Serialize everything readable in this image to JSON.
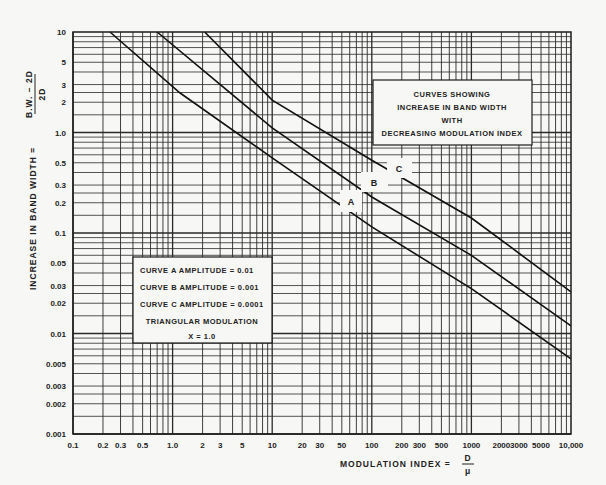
{
  "chart_data": {
    "type": "line",
    "title": "CURVES SHOWING INCREASE IN BAND WIDTH WITH DECREASING MODULATION INDEX",
    "xlabel": "MODULATION INDEX = D/μ",
    "ylabel": "INCREASE IN BAND WIDTH = (B.W. − 2D)/2D",
    "xscale": "log",
    "yscale": "log",
    "xlim": [
      0.1,
      10000
    ],
    "ylim": [
      0.001,
      10
    ],
    "grid": true,
    "x_ticks": [
      {
        "v": 0.1,
        "label": "0.1"
      },
      {
        "v": 0.2,
        "label": "0.2"
      },
      {
        "v": 0.3,
        "label": "0.3"
      },
      {
        "v": 0.5,
        "label": "0.5"
      },
      {
        "v": 1,
        "label": "1.0"
      },
      {
        "v": 2,
        "label": "2"
      },
      {
        "v": 3,
        "label": "3"
      },
      {
        "v": 5,
        "label": "5"
      },
      {
        "v": 10,
        "label": "10"
      },
      {
        "v": 20,
        "label": "20"
      },
      {
        "v": 30,
        "label": "30"
      },
      {
        "v": 50,
        "label": "50"
      },
      {
        "v": 100,
        "label": "100"
      },
      {
        "v": 200,
        "label": "200"
      },
      {
        "v": 300,
        "label": "300"
      },
      {
        "v": 500,
        "label": "500"
      },
      {
        "v": 1000,
        "label": "1000"
      },
      {
        "v": 2000,
        "label": "2000"
      },
      {
        "v": 3000,
        "label": "3000"
      },
      {
        "v": 5000,
        "label": "5000"
      },
      {
        "v": 10000,
        "label": "10,000"
      }
    ],
    "y_ticks": [
      {
        "v": 10,
        "label": "10"
      },
      {
        "v": 5,
        "label": "5"
      },
      {
        "v": 3,
        "label": "3"
      },
      {
        "v": 2,
        "label": "2"
      },
      {
        "v": 1,
        "label": "1.0"
      },
      {
        "v": 0.5,
        "label": "0.5"
      },
      {
        "v": 0.3,
        "label": "0.3"
      },
      {
        "v": 0.2,
        "label": "0.2"
      },
      {
        "v": 0.1,
        "label": "0.1"
      },
      {
        "v": 0.05,
        "label": "0.05"
      },
      {
        "v": 0.03,
        "label": "0.03"
      },
      {
        "v": 0.02,
        "label": "0.02"
      },
      {
        "v": 0.01,
        "label": "0.01"
      },
      {
        "v": 0.005,
        "label": "0.005"
      },
      {
        "v": 0.003,
        "label": "0.003"
      },
      {
        "v": 0.002,
        "label": "0.002"
      },
      {
        "v": 0.001,
        "label": "0.001"
      }
    ],
    "series": [
      {
        "name": "A",
        "label": "CURVE A AMPLITUDE = 0.01",
        "x": [
          0.235,
          1.19,
          10,
          100,
          1000,
          10000
        ],
        "y": [
          10,
          2.47,
          0.56,
          0.115,
          0.028,
          0.0056
        ]
      },
      {
        "name": "B",
        "label": "CURVE B AMPLITUDE = 0.001",
        "x": [
          0.7,
          10,
          100,
          1000,
          10000
        ],
        "y": [
          10,
          1.11,
          0.228,
          0.06,
          0.0119
        ]
      },
      {
        "name": "C",
        "label": "CURVE C AMPLITUDE = 0.0001",
        "x": [
          2.1,
          10,
          100,
          1000,
          10000
        ],
        "y": [
          10,
          2.1,
          0.53,
          0.141,
          0.026
        ]
      }
    ],
    "annotations": [
      {
        "text": "A",
        "x": 60,
        "y": 0.22
      },
      {
        "text": "B",
        "x": 130,
        "y": 0.33
      },
      {
        "text": "C",
        "x": 220,
        "y": 0.46
      }
    ],
    "title_box": {
      "lines": [
        "CURVES SHOWING",
        "INCREASE IN BAND WIDTH",
        "WITH",
        "DECREASING MODULATION INDEX"
      ]
    },
    "legend": {
      "position": "lower-left",
      "lines": [
        "CURVE A AMPLITUDE = 0.01",
        "CURVE B AMPLITUDE = 0.001",
        "CURVE C AMPLITUDE = 0.0001",
        "TRIANGULAR MODULATION",
        "X = 1.0"
      ]
    }
  },
  "axis_titles": {
    "x_prefix": "MODULATION   INDEX  =",
    "x_num": "D",
    "x_den": "μ",
    "y_prefix": "INCREASE  IN  BAND  WIDTH  =",
    "y_num": "B.W. − 2D",
    "y_den": "2D"
  },
  "colors": {
    "paper": "#f7f7f5",
    "ink": "#1c1c1c",
    "grid": "#2a2a2a"
  }
}
